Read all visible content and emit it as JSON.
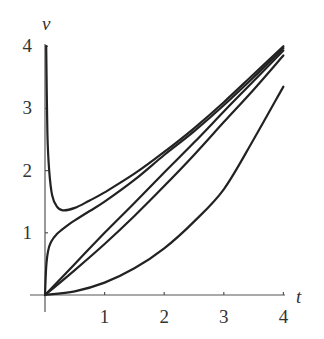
{
  "chart_data": {
    "type": "line",
    "title": "",
    "xlabel": "t",
    "ylabel": "v",
    "xlim": [
      0,
      4
    ],
    "ylim": [
      0,
      4
    ],
    "grid": false,
    "legend": null,
    "x_ticks": [
      "1",
      "2",
      "3",
      "4"
    ],
    "y_ticks": [
      "1",
      "2",
      "3",
      "4"
    ],
    "series": [
      {
        "name": "curve-1",
        "points": [
          [
            0.02,
            4.0
          ],
          [
            0.04,
            2.6
          ],
          [
            0.07,
            2.0
          ],
          [
            0.12,
            1.6
          ],
          [
            0.2,
            1.42
          ],
          [
            0.3,
            1.36
          ],
          [
            0.5,
            1.4
          ],
          [
            0.75,
            1.52
          ],
          [
            1.0,
            1.65
          ],
          [
            1.5,
            1.95
          ],
          [
            2.0,
            2.3
          ],
          [
            2.5,
            2.68
          ],
          [
            3.0,
            3.1
          ],
          [
            3.5,
            3.55
          ],
          [
            4.0,
            4.0
          ]
        ]
      },
      {
        "name": "curve-2",
        "points": [
          [
            0.0,
            0.0
          ],
          [
            0.02,
            0.45
          ],
          [
            0.05,
            0.7
          ],
          [
            0.1,
            0.85
          ],
          [
            0.2,
            0.98
          ],
          [
            0.35,
            1.1
          ],
          [
            0.5,
            1.2
          ],
          [
            0.75,
            1.35
          ],
          [
            1.0,
            1.5
          ],
          [
            1.5,
            1.85
          ],
          [
            2.0,
            2.25
          ],
          [
            2.5,
            2.63
          ],
          [
            3.0,
            3.05
          ],
          [
            3.5,
            3.5
          ],
          [
            4.0,
            3.97
          ]
        ]
      },
      {
        "name": "curve-3",
        "points": [
          [
            0.0,
            0.0
          ],
          [
            0.5,
            0.5
          ],
          [
            1.0,
            1.0
          ],
          [
            1.5,
            1.48
          ],
          [
            2.0,
            1.97
          ],
          [
            2.5,
            2.45
          ],
          [
            3.0,
            2.95
          ],
          [
            3.5,
            3.44
          ],
          [
            4.0,
            3.93
          ]
        ]
      },
      {
        "name": "curve-4",
        "points": [
          [
            0.0,
            0.0
          ],
          [
            0.5,
            0.4
          ],
          [
            1.0,
            0.82
          ],
          [
            1.5,
            1.27
          ],
          [
            2.0,
            1.75
          ],
          [
            2.5,
            2.25
          ],
          [
            3.0,
            2.78
          ],
          [
            3.5,
            3.3
          ],
          [
            4.0,
            3.85
          ]
        ]
      },
      {
        "name": "curve-5",
        "points": [
          [
            0.0,
            0.0
          ],
          [
            0.5,
            0.06
          ],
          [
            1.0,
            0.2
          ],
          [
            1.5,
            0.43
          ],
          [
            2.0,
            0.75
          ],
          [
            2.5,
            1.18
          ],
          [
            3.0,
            1.7
          ],
          [
            3.5,
            2.5
          ],
          [
            4.0,
            3.35
          ]
        ]
      }
    ]
  },
  "axes": {
    "x_label": "t",
    "y_label": "v",
    "x_tick_labels": [
      "1",
      "2",
      "3",
      "4"
    ],
    "y_tick_labels": [
      "1",
      "2",
      "3",
      "4"
    ]
  }
}
